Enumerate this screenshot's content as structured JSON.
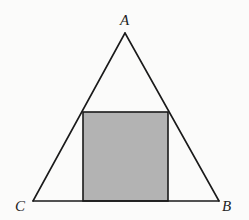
{
  "diagram": {
    "triangle": {
      "vertices": [
        {
          "name": "A",
          "label": "A"
        },
        {
          "name": "B",
          "label": "B"
        },
        {
          "name": "C",
          "label": "C"
        }
      ],
      "sides": [
        "AB",
        "BC",
        "CA"
      ]
    },
    "inscribed_square": {
      "base_on_side": "CB",
      "top_corners_on": [
        "AC",
        "AB"
      ],
      "shaded": true
    },
    "colors": {
      "stroke": "#1a1a1a",
      "square_fill": "#b3b3b3",
      "background": "#fbfbfa"
    }
  }
}
